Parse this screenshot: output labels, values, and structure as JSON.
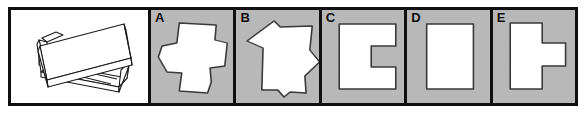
{
  "item": {
    "type": "spatial-reasoning-multiple-choice",
    "prompt_panel_label": "",
    "stimulus": {
      "description": "three-dimensional folded sheet object drawn in line art",
      "fill_color": "#ffffff",
      "line_color": "#1a1a1a"
    },
    "border_color": "#101010",
    "option_background": "#b8b8b8",
    "shape_fill": "#ffffff",
    "shape_outline": "#3a3a3a"
  },
  "options": [
    {
      "letter": "A",
      "shape_name": "irregular-cross-polygon",
      "description": "irregular cross / plus-like polygon with slanted edges"
    },
    {
      "letter": "B",
      "shape_name": "irregular-heptagon",
      "description": "irregular polygon with angled left point and notched bottom"
    },
    {
      "letter": "C",
      "shape_name": "c-shaped-rectangle",
      "description": "rectangle with a square notch cut into the right side"
    },
    {
      "letter": "D",
      "shape_name": "plain-rectangle",
      "description": "plain upright rectangle"
    },
    {
      "letter": "E",
      "shape_name": "rectangle-with-right-tab",
      "description": "upright rectangle with a rectangular tab protruding from the right side"
    }
  ]
}
